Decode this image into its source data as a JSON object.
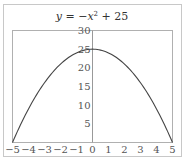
{
  "chart_data": {
    "type": "line",
    "title_parts": {
      "y": "y",
      "eq": " = −",
      "x": "x",
      "sup": "2",
      "rest": " + 25"
    },
    "xlabel": "",
    "ylabel": "",
    "xlim": [
      -5,
      5
    ],
    "ylim": [
      0,
      30
    ],
    "xticks": [
      -5,
      -4,
      -3,
      -2,
      -1,
      0,
      1,
      2,
      3,
      4,
      5
    ],
    "xtick_labels": [
      "−5",
      "−4",
      "−3",
      "−2",
      "−1",
      "0",
      "1",
      "2",
      "3",
      "4",
      "5"
    ],
    "yticks": [
      5,
      10,
      15,
      20,
      25,
      30
    ],
    "ytick_labels": [
      "5",
      "10",
      "15",
      "20",
      "25",
      "30"
    ],
    "grid": false,
    "legend": null,
    "series": [
      {
        "name": "y = -x^2 + 25",
        "x": [
          -5,
          -4,
          -3,
          -2,
          -1,
          0,
          1,
          2,
          3,
          4,
          5
        ],
        "y": [
          0,
          9,
          16,
          21,
          24,
          25,
          24,
          21,
          16,
          9,
          0
        ]
      }
    ],
    "colors": {
      "curve": "#444444",
      "axes": "#999999",
      "frame": "#bbbbbb",
      "text": "#555555"
    }
  }
}
